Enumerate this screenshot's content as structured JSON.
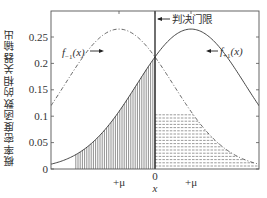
{
  "chart_data": {
    "type": "line",
    "title": "",
    "xlabel": "x",
    "ylabel": "概率密度函数的相关器输出",
    "ylim": [
      0,
      0.3
    ],
    "yticks": [
      0,
      0.05,
      0.1,
      0.15,
      0.2,
      0.25
    ],
    "ytick_labels": [
      "0",
      "0.05",
      "0.1",
      "0.15",
      "0.2",
      "0.25"
    ],
    "xticks": [
      "+μ",
      "0",
      "+μ"
    ],
    "grid": false,
    "legend": "none (inline annotations)",
    "series": [
      {
        "name": "f_{-1}(x)",
        "label": "f₋₁(x)",
        "style": "dash-dot",
        "mean": -1,
        "sigma": 1.5,
        "peak": 0.265
      },
      {
        "name": "f_{+1}(x)",
        "label": "f₊₁(x)",
        "style": "solid",
        "mean": 1,
        "sigma": 1.5,
        "peak": 0.265
      }
    ],
    "threshold": {
      "x": 0,
      "label": "判决门限"
    },
    "crossing_value": 0.108,
    "shaded_regions": [
      {
        "description": "tail of f+1 left of threshold",
        "pattern": "vertical hatch"
      },
      {
        "description": "tail of f-1 right of threshold",
        "pattern": "horizontal dashed hatch"
      }
    ],
    "annotations": [
      "f₋₁(x)",
      "f₊₁(x)",
      "判决门限"
    ]
  },
  "labels": {
    "ylabel": "概率密度函数的相关器输出",
    "xlabel": "x",
    "threshold": "判决门限",
    "f_minus_main": "f",
    "f_minus_sub": "−1",
    "f_plus_main": "f",
    "f_plus_sub": "+1",
    "fx_arg": "(x)",
    "mu_left": "+μ",
    "mu_right": "+μ",
    "zero": "0"
  }
}
